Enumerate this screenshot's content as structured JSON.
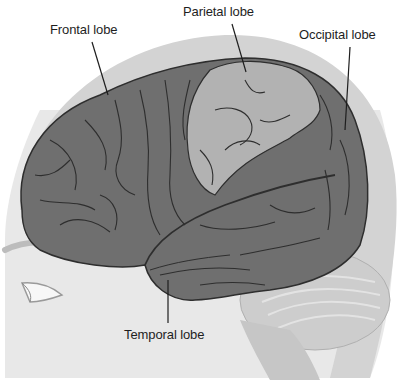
{
  "diagram": {
    "labels": [
      {
        "id": "frontal",
        "text": "Frontal lobe",
        "x": 50,
        "y": 22
      },
      {
        "id": "parietal",
        "text": "Parietal lobe",
        "x": 183,
        "y": 4
      },
      {
        "id": "occipital",
        "text": "Occipital lobe",
        "x": 299,
        "y": 27
      },
      {
        "id": "temporal",
        "text": "Temporal lobe",
        "x": 124,
        "y": 327
      }
    ],
    "leaders": [
      {
        "id": "frontal",
        "x1": 92,
        "y1": 42,
        "x2": 108,
        "y2": 95
      },
      {
        "id": "parietal",
        "x1": 232,
        "y1": 24,
        "x2": 246,
        "y2": 72
      },
      {
        "id": "occipital",
        "x1": 350,
        "y1": 47,
        "x2": 345,
        "y2": 130
      },
      {
        "id": "temporal",
        "x1": 168,
        "y1": 280,
        "x2": 168,
        "y2": 323
      }
    ],
    "colors": {
      "lobe_dark": "#6e6e6e",
      "lobe_light": "#b4b4b4",
      "skull": "#d2d2d2",
      "skin": "#e9e9e9",
      "cerebellum": "#cfcfcf",
      "sulcus": "#2e2e2e",
      "text": "#1e1e1e"
    }
  }
}
